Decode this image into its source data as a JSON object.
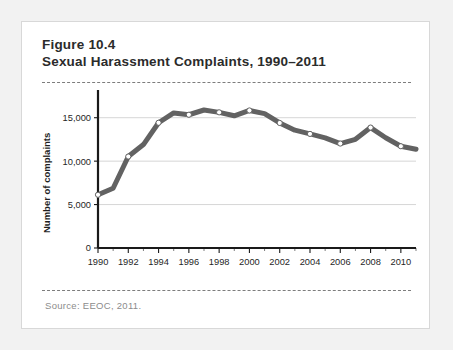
{
  "figure": {
    "title_line1": "Figure 10.4",
    "title_line2": "Sexual Harassment Complaints, 1990–2011",
    "source": "Source: EEOC, 2011."
  },
  "colors": {
    "line": "#626262",
    "marker_fill": "#ffffff",
    "grid": "#d6d6d6",
    "axis": "#1a1a1a",
    "card_background": "#ffffff",
    "page_background": "#f2f2f2",
    "source_text": "#8c8c8c"
  },
  "chart_data": {
    "type": "line",
    "title": "Sexual Harassment Complaints, 1990–2011",
    "xlabel": "",
    "ylabel": "Number of complaints",
    "x": [
      1990,
      1991,
      1992,
      1993,
      1994,
      1995,
      1996,
      1997,
      1998,
      1999,
      2000,
      2001,
      2002,
      2003,
      2004,
      2005,
      2006,
      2007,
      2008,
      2009,
      2010,
      2011
    ],
    "values": [
      6127,
      6883,
      10532,
      11908,
      14420,
      15549,
      15342,
      15889,
      15618,
      15222,
      15836,
      15475,
      14396,
      13566,
      13136,
      12679,
      12025,
      12510,
      13867,
      12696,
      11717,
      11364
    ],
    "ylim": [
      0,
      17500
    ],
    "xlim": [
      1990,
      2011
    ],
    "yticks": [
      0,
      5000,
      10000,
      15000
    ],
    "ytick_labels": [
      "0",
      "5,000",
      "10,000",
      "15,000"
    ],
    "xticks": [
      1990,
      1992,
      1994,
      1996,
      1998,
      2000,
      2002,
      2004,
      2006,
      2008,
      2010
    ],
    "xtick_labels": [
      "1990",
      "1992",
      "1994",
      "1996",
      "1998",
      "2000",
      "2002",
      "2004",
      "2006",
      "2008",
      "2010"
    ],
    "xticks_minor": [
      1991,
      1993,
      1995,
      1997,
      1999,
      2001,
      2003,
      2005,
      2007,
      2009,
      2011
    ],
    "marker_years": [
      1990,
      1992,
      1994,
      1996,
      1998,
      2000,
      2002,
      2004,
      2006,
      2008,
      2010
    ],
    "grid": "horizontal",
    "legend": "none"
  }
}
